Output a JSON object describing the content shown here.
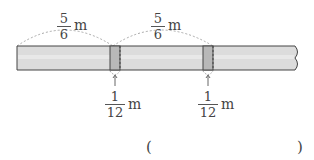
{
  "diagram": {
    "top_labels": [
      {
        "numerator": "5",
        "denominator": "6",
        "unit": "m"
      },
      {
        "numerator": "5",
        "denominator": "6",
        "unit": "m"
      }
    ],
    "bottom_labels": [
      {
        "numerator": "1",
        "denominator": "12",
        "unit": "m"
      },
      {
        "numerator": "1",
        "denominator": "12",
        "unit": "m"
      }
    ],
    "answer": {
      "open": "(",
      "close": ")"
    },
    "colors": {
      "tape": "#d9d9d9",
      "overlap": "#b5b5b5",
      "outline": "#444444"
    }
  }
}
